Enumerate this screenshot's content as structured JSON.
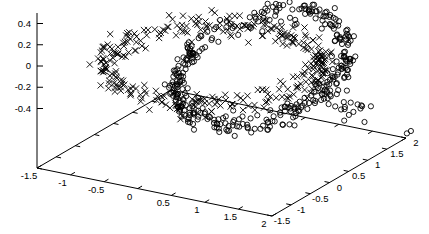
{
  "figure": {
    "background": "#ffffff",
    "ink_color": "#000000"
  },
  "chart_data": {
    "type": "scatter",
    "projection": "3d",
    "title": "",
    "legend": "none",
    "grid": "off",
    "axes": {
      "x": {
        "range": [
          -1.5,
          2
        ],
        "tick_labels": [
          "-1.5",
          "-1",
          "-0.5",
          "0",
          "0.5",
          "1",
          "1.5",
          "2"
        ]
      },
      "y": {
        "range": [
          -1.5,
          2
        ],
        "tick_labels": [
          "-1.5",
          "-1",
          "-0.5",
          "0",
          "0.5",
          "1",
          "1.5",
          "2"
        ]
      },
      "z": {
        "range": [
          -0.5,
          0.5
        ],
        "tick_labels": [
          "-0.4",
          "-0.2",
          "0",
          "0.2",
          "0.4"
        ]
      }
    },
    "series": [
      {
        "name": "ring-1-crosses",
        "marker": "cross",
        "color": "#000000",
        "count": 340,
        "data_desc": {
          "shape": "noisy circular ring",
          "plane": "horizontal (xy)",
          "center": [
            0.5,
            -0.3,
            0.0
          ],
          "radius": 1.4,
          "noise_sigma": 0.05
        }
      },
      {
        "name": "ring-2-circles",
        "marker": "open-circle",
        "color": "#000000",
        "count": 370,
        "data_desc": {
          "shape": "noisy circular ring, interlocked with ring-1",
          "plane": "xy tilted ~18 deg about x-axis",
          "center": [
            1.1,
            -0.2,
            0.0
          ],
          "radius": 1.1,
          "noise_sigma": 0.05
        }
      }
    ],
    "render": {
      "seed": 20,
      "corners": {
        "L": [
          37,
          168
        ],
        "F": [
          272,
          216
        ],
        "R": [
          406,
          138
        ],
        "B": [
          171,
          90
        ]
      },
      "z_axis": {
        "x": 37,
        "top_y": 13,
        "z0_y": 66,
        "px_per_unit": 106.25,
        "tick_len": 6
      },
      "tick_len": 5,
      "x_tick_dir": [
        0.864,
        -0.503
      ],
      "y_tick_dir": [
        -0.979,
        -0.205
      ],
      "x_label_offset": [
        -8,
        11
      ],
      "y_label_offset": [
        10,
        8
      ],
      "z_label_x": 31,
      "z_label_dy": 3,
      "marker_stroke": 0.9,
      "ellipses": [
        {
          "name": "ring-1-crosses",
          "marker": "cross",
          "C": [
            214,
            64
          ],
          "E1": [
            96,
            16
          ],
          "E2": [
            52,
            -36
          ],
          "sr": 0.045,
          "jx": 3,
          "jy": 6,
          "n": 340,
          "size": 3.1
        },
        {
          "name": "ring-2-circles",
          "marker": "circle",
          "C": [
            262,
            68
          ],
          "E1": [
            83,
            -4
          ],
          "E2": [
            -22,
            56
          ],
          "sr": 0.05,
          "jx": 2.5,
          "jy": 6,
          "n": 370,
          "size": 2.6
        }
      ],
      "extra_clusters": [
        {
          "name": "ring-2-circles-spur",
          "marker": "circle",
          "center": [
            352,
            110
          ],
          "sx": 9,
          "sy": 6,
          "n": 16,
          "size": 2.6
        },
        {
          "name": "ring-2-stray",
          "marker": "circle",
          "center": [
            410,
            133
          ],
          "sx": 2,
          "sy": 1.5,
          "n": 2,
          "size": 2.6
        }
      ]
    }
  }
}
